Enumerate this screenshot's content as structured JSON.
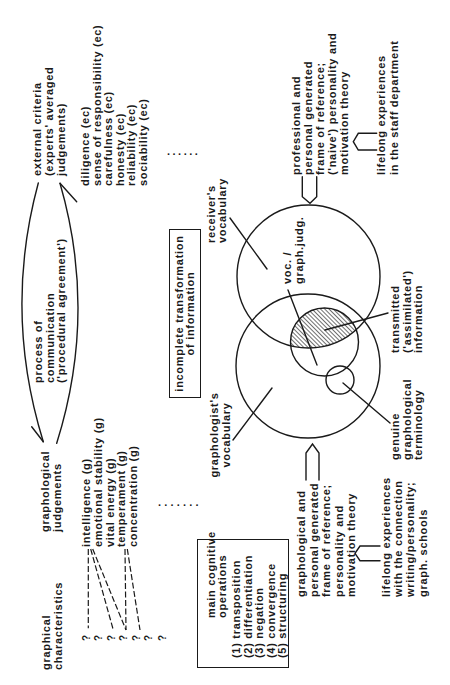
{
  "graphical_characteristics": {
    "heading": [
      "graphical",
      "characteristics"
    ],
    "markers": [
      "?",
      "?",
      "?",
      "?",
      "?",
      "?",
      "?"
    ]
  },
  "graphological_judgements": {
    "heading": [
      "graphological",
      "judgements"
    ],
    "items": [
      "intelligence (g)",
      "emotional stability (g)",
      "vital energy (g)",
      "temperament (g)",
      "concentration (g)"
    ],
    "continuation": "......."
  },
  "process_of_communication": {
    "lines": [
      "process of",
      "communication",
      "('procedural agreement')"
    ]
  },
  "external_criteria": {
    "heading": [
      "external criteria",
      "(experts' averaged",
      "judgements)"
    ],
    "items": [
      "diligence (ec)",
      "sense of responsibility (ec)",
      "carefulness (ec)",
      "honesty (ec)",
      "reliability (ec)",
      "sociability (ec)"
    ],
    "continuation": "......"
  },
  "cognitive_operations": {
    "title": [
      "main cognitive",
      "operations"
    ],
    "items": [
      "(1) transposition",
      "(2) differentiation",
      "(3) negation",
      "(4) convergence",
      "(5) structuring"
    ]
  },
  "incomplete_transformation": {
    "lines": [
      "incomplete transformation",
      "of information"
    ]
  },
  "venn": {
    "receiver_vocabulary": [
      "receiver's",
      "vocabulary"
    ],
    "graphologist_vocabulary": [
      "graphologist's",
      "vocabulary"
    ],
    "overlap_label": [
      "voc. /",
      "graph.judg."
    ],
    "transmitted": [
      "transmitted",
      "('assimilated')",
      "information"
    ],
    "genuine_terminology": [
      "genuine",
      "graphological",
      "terminology"
    ]
  },
  "graphologist_frame": {
    "lines": [
      "graphological and",
      "personal generated",
      "frame of reference;",
      "personality and",
      "motivation theory"
    ],
    "source": [
      "lifelong experiences",
      "with the connection",
      "writing/personality;",
      "graph. schools"
    ]
  },
  "receiver_frame": {
    "lines": [
      "professional and",
      "personal generated",
      "frame of reference;",
      "('naive') personality and",
      "motivation theory"
    ],
    "source": [
      "lifelong experiences",
      "in the staff department"
    ]
  },
  "colors": {
    "ink": "#1a1a1a",
    "background": "#ffffff",
    "hatch": "#222222"
  }
}
